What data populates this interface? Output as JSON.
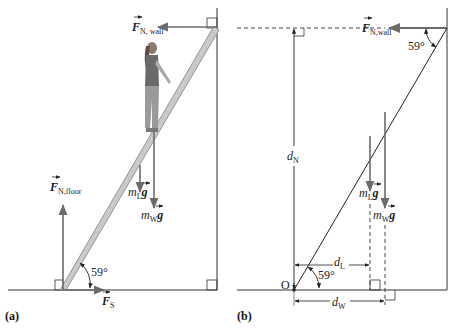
{
  "figure": {
    "panel_a": {
      "label": "(a)",
      "forces": {
        "normal_wall": {
          "symbol": "F",
          "subscript": "N, wall"
        },
        "normal_floor": {
          "symbol": "F",
          "subscript": "N,floor"
        },
        "static_friction": {
          "symbol": "F",
          "subscript": "S"
        },
        "ladder_weight": {
          "mass": "m",
          "subscript": "L",
          "g": "g"
        },
        "woman_weight": {
          "mass": "m",
          "subscript": "W",
          "g": "g"
        }
      },
      "angle": "59°"
    },
    "panel_b": {
      "label": "(b)",
      "forces": {
        "normal_wall": {
          "symbol": "F",
          "subscript": "N,wall"
        },
        "ladder_weight": {
          "mass": "m",
          "subscript": "L",
          "g": "g"
        },
        "woman_weight": {
          "mass": "m",
          "subscript": "W",
          "g": "g"
        }
      },
      "angle_top": "59°",
      "angle_bottom": "59°",
      "origin": "O",
      "distances": {
        "d_N": {
          "symbol": "d",
          "subscript": "N"
        },
        "d_L": {
          "symbol": "d",
          "subscript": "L"
        },
        "d_W": {
          "symbol": "d",
          "subscript": "W"
        }
      }
    },
    "colors": {
      "line": "#333333",
      "arrow": "#6b6b6b",
      "ladder": "#bdbdbd"
    }
  }
}
